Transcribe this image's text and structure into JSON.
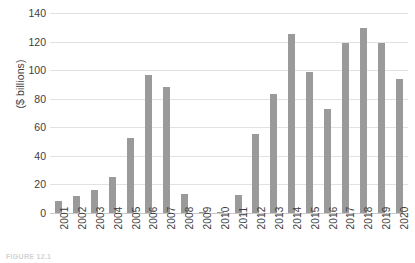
{
  "chart_data": {
    "type": "bar",
    "title": "",
    "subtitle": "",
    "xlabel": "",
    "ylabel": "($ billions)",
    "ylim": [
      0,
      140
    ],
    "yticks": [
      140,
      120,
      100,
      80,
      60,
      40,
      20,
      0
    ],
    "grid": true,
    "legend": null,
    "bar_color": "#9a9a9a",
    "gridline_color": "#e2e2e2",
    "categories": [
      "2001",
      "2002",
      "2003",
      "2004",
      "2005",
      "2006",
      "2007",
      "2008",
      "2009",
      "2010",
      "2011",
      "2012",
      "2013",
      "2014",
      "2015",
      "2016",
      "2017",
      "2018",
      "2019",
      "2020"
    ],
    "values": [
      8.5,
      12,
      16,
      25,
      52.5,
      96.5,
      88.5,
      13.5,
      1,
      1,
      12.5,
      55,
      83,
      125,
      99,
      73,
      119,
      129.5,
      119,
      94
    ]
  },
  "caption": {
    "text": "FIGURE 12.1"
  }
}
